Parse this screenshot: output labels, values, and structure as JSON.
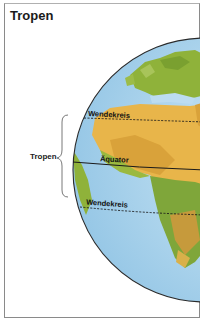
{
  "title": "Tropen",
  "labels": {
    "tropen": "Tropen",
    "wendekreis_north": "Wendekreis",
    "aequator": "Äquator",
    "wendekreis_south": "Wendekreis"
  },
  "colors": {
    "ocean": "#a9d4ec",
    "land_desert": "#e8b54a",
    "land_green": "#8fb23a",
    "outline": "#2a2a2a",
    "frame": "#8a8a8a"
  }
}
